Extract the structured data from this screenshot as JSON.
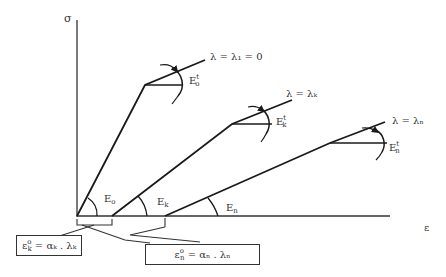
{
  "axes": {
    "y_label": "σ",
    "x_label": "ε"
  },
  "branches": [
    {
      "id": "0",
      "lambda_label": "λ = λ₁ = 0",
      "slope_label": "E",
      "slope_sub": "o",
      "tangent_label": "E",
      "tangent_sup": "t",
      "tangent_sub": "o"
    },
    {
      "id": "k",
      "lambda_label": "λ = λₖ",
      "slope_label": "E",
      "slope_sub": "k",
      "tangent_label": "E",
      "tangent_sup": "t",
      "tangent_sub": "k"
    },
    {
      "id": "n",
      "lambda_label": "λ = λₙ",
      "slope_label": "E",
      "slope_sub": "n",
      "tangent_label": "E",
      "tangent_sup": "t",
      "tangent_sub": "n"
    }
  ],
  "callouts": [
    {
      "id": "k",
      "text": "ε",
      "sup": "o",
      "sub": "k",
      "rest": "= αₖ . λₖ"
    },
    {
      "id": "n",
      "text": "ε",
      "sup": "o",
      "sub": "n",
      "rest": "= αₙ . λₙ"
    }
  ],
  "colors": {
    "line": "#1a1a1a",
    "axis": "#333333",
    "background": "#ffffff"
  }
}
